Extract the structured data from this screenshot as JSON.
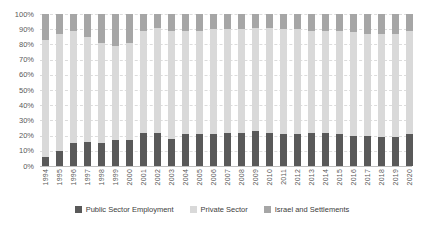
{
  "chart_data": {
    "type": "bar",
    "subtype": "stacked-100-percent-column",
    "categories": [
      "1994",
      "1995",
      "1996",
      "1997",
      "1998",
      "1999",
      "2000",
      "2001",
      "2002",
      "2003",
      "2004",
      "2005",
      "2006",
      "2007",
      "2008",
      "2009",
      "2010",
      "2011",
      "2012",
      "2013",
      "2014",
      "2015",
      "2016",
      "2017",
      "2018",
      "2019",
      "2020"
    ],
    "series": [
      {
        "name": "Public Sector Employment",
        "color": "#595959",
        "values": [
          6,
          10,
          15,
          16,
          15,
          17,
          17,
          22,
          22,
          18,
          21,
          21,
          21,
          22,
          22,
          23,
          22,
          21,
          21,
          22,
          22,
          21,
          20,
          20,
          19,
          19,
          21
        ]
      },
      {
        "name": "Private Sector",
        "color": "#d9d9d9",
        "values": [
          77,
          77,
          74,
          69,
          66,
          62,
          64,
          67,
          69,
          71,
          68,
          68,
          69,
          68,
          68,
          68,
          69,
          69,
          69,
          67,
          67,
          68,
          68,
          67,
          68,
          68,
          68
        ]
      },
      {
        "name": "Israel and Settlements",
        "color": "#a6a6a6",
        "values": [
          17,
          13,
          11,
          15,
          19,
          21,
          19,
          11,
          9,
          11,
          11,
          11,
          10,
          10,
          10,
          9,
          9,
          10,
          10,
          11,
          11,
          11,
          12,
          13,
          13,
          13,
          11
        ]
      }
    ],
    "xlabel": "",
    "ylabel": "",
    "ylim": [
      0,
      100
    ],
    "y_ticks": [
      "0%",
      "10%",
      "20%",
      "30%",
      "40%",
      "50%",
      "60%",
      "70%",
      "80%",
      "90%",
      "100%"
    ],
    "grid": "horizontal-dashed",
    "legend_position": "bottom",
    "x_tick_rotation": -90
  },
  "style": {
    "gridline_color": "#dcdcdc",
    "axis_line_color": "#bfbfbf",
    "tick_label_color": "#595959",
    "legend_text_color": "#404040",
    "background": "#ffffff"
  }
}
